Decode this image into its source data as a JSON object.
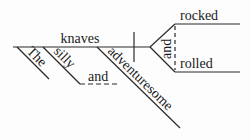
{
  "diagram": {
    "type": "reed-kellogg-sentence-diagram",
    "subject": "knaves",
    "modifiers": [
      "The",
      "silly",
      "adventuresome"
    ],
    "modifier_conjunction": "and",
    "predicates": [
      "rocked",
      "rolled"
    ],
    "predicate_conjunction": "and"
  }
}
